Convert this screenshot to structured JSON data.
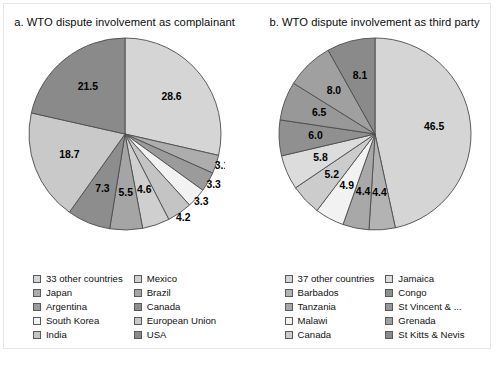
{
  "figure": {
    "caption": ""
  },
  "panels": [
    {
      "id": "panel-a",
      "title": "a. WTO dispute involvement as complainant",
      "legend": [
        {
          "label": "33 other countries",
          "color": "#d5d5d5"
        },
        {
          "label": "Japan",
          "color": "#adadad"
        },
        {
          "label": "Argentina",
          "color": "#9b9b9b"
        },
        {
          "label": "South Korea",
          "color": "#f2f2f2"
        },
        {
          "label": "India",
          "color": "#c4c4c4"
        },
        {
          "label": "Mexico",
          "color": "#cfcfcf"
        },
        {
          "label": "Brazil",
          "color": "#a5a5a5"
        },
        {
          "label": "Canada",
          "color": "#8d8d8d"
        },
        {
          "label": "European Union",
          "color": "#c9c9c9"
        },
        {
          "label": "USA",
          "color": "#8a8a8a"
        }
      ]
    },
    {
      "id": "panel-b",
      "title": "b. WTO dispute involvement as third party",
      "legend": [
        {
          "label": "37 other countries",
          "color": "#d5d5d5"
        },
        {
          "label": "Barbados",
          "color": "#b3b3b3"
        },
        {
          "label": "Tanzania",
          "color": "#a8a8a8"
        },
        {
          "label": "Malawi",
          "color": "#f2f2f2"
        },
        {
          "label": "Canada",
          "color": "#cccccc"
        },
        {
          "label": "Jamaica",
          "color": "#dcdcdc"
        },
        {
          "label": "Congo",
          "color": "#909090"
        },
        {
          "label": "St Vincent & ...",
          "color": "#989898"
        },
        {
          "label": "Grenada",
          "color": "#a0a0a0"
        },
        {
          "label": "St Kitts & Nevis",
          "color": "#8a8a8a"
        }
      ]
    }
  ],
  "chart_data": [
    {
      "type": "pie",
      "title": "a. WTO dispute involvement as complainant",
      "start_angle_deg": 0,
      "direction": "clockwise",
      "units": "percent",
      "labels": [
        "33 other countries",
        "Japan",
        "Argentina",
        "South Korea",
        "India",
        "Mexico",
        "Brazil",
        "Canada",
        "European Union",
        "USA"
      ],
      "values": [
        28.6,
        3.1,
        3.3,
        3.3,
        4.2,
        4.6,
        5.5,
        7.3,
        18.7,
        21.5
      ],
      "slices": [
        {
          "label": "33 other countries",
          "value": 28.6,
          "color": "#d5d5d5",
          "label_outside": false
        },
        {
          "label": "Japan",
          "value": 3.1,
          "color": "#adadad",
          "label_outside": true
        },
        {
          "label": "Argentina",
          "value": 3.3,
          "color": "#9b9b9b",
          "label_outside": true
        },
        {
          "label": "South Korea",
          "value": 3.3,
          "color": "#f2f2f2",
          "label_outside": true
        },
        {
          "label": "India",
          "value": 4.2,
          "color": "#c4c4c4",
          "label_outside": true
        },
        {
          "label": "Mexico",
          "value": 4.6,
          "color": "#cfcfcf",
          "label_outside": false
        },
        {
          "label": "Brazil",
          "value": 5.5,
          "color": "#a5a5a5",
          "label_outside": false
        },
        {
          "label": "Canada",
          "value": 7.3,
          "color": "#8d8d8d",
          "label_outside": false
        },
        {
          "label": "European Union",
          "value": 18.7,
          "color": "#c9c9c9",
          "label_outside": false
        },
        {
          "label": "USA",
          "value": 21.5,
          "color": "#8a8a8a",
          "label_outside": false
        }
      ]
    },
    {
      "type": "pie",
      "title": "b. WTO dispute involvement as third party",
      "start_angle_deg": 0,
      "direction": "clockwise",
      "units": "percent",
      "labels": [
        "37 other countries",
        "Barbados",
        "Tanzania",
        "Malawi",
        "Canada",
        "Jamaica",
        "Congo",
        "St Vincent & ...",
        "Grenada",
        "St Kitts & Nevis"
      ],
      "values": [
        46.5,
        4.4,
        4.4,
        4.9,
        5.2,
        5.8,
        6.0,
        6.5,
        8.0,
        8.1
      ],
      "slices": [
        {
          "label": "37 other countries",
          "value": 46.5,
          "color": "#d5d5d5",
          "label_outside": false
        },
        {
          "label": "Barbados",
          "value": 4.4,
          "color": "#b3b3b3",
          "label_outside": false
        },
        {
          "label": "Tanzania",
          "value": 4.4,
          "color": "#a8a8a8",
          "label_outside": false
        },
        {
          "label": "Malawi",
          "value": 4.9,
          "color": "#f2f2f2",
          "label_outside": false
        },
        {
          "label": "Canada",
          "value": 5.2,
          "color": "#cccccc",
          "label_outside": false
        },
        {
          "label": "Jamaica",
          "value": 5.8,
          "color": "#dcdcdc",
          "label_outside": false
        },
        {
          "label": "Congo",
          "value": 6.0,
          "color": "#909090",
          "label_outside": false
        },
        {
          "label": "St Vincent & ...",
          "value": 6.5,
          "color": "#989898",
          "label_outside": false
        },
        {
          "label": "Grenada",
          "value": 8.0,
          "color": "#a0a0a0",
          "label_outside": false
        },
        {
          "label": "St Kitts & Nevis",
          "value": 8.1,
          "color": "#8a8a8a",
          "label_outside": false
        }
      ]
    }
  ]
}
